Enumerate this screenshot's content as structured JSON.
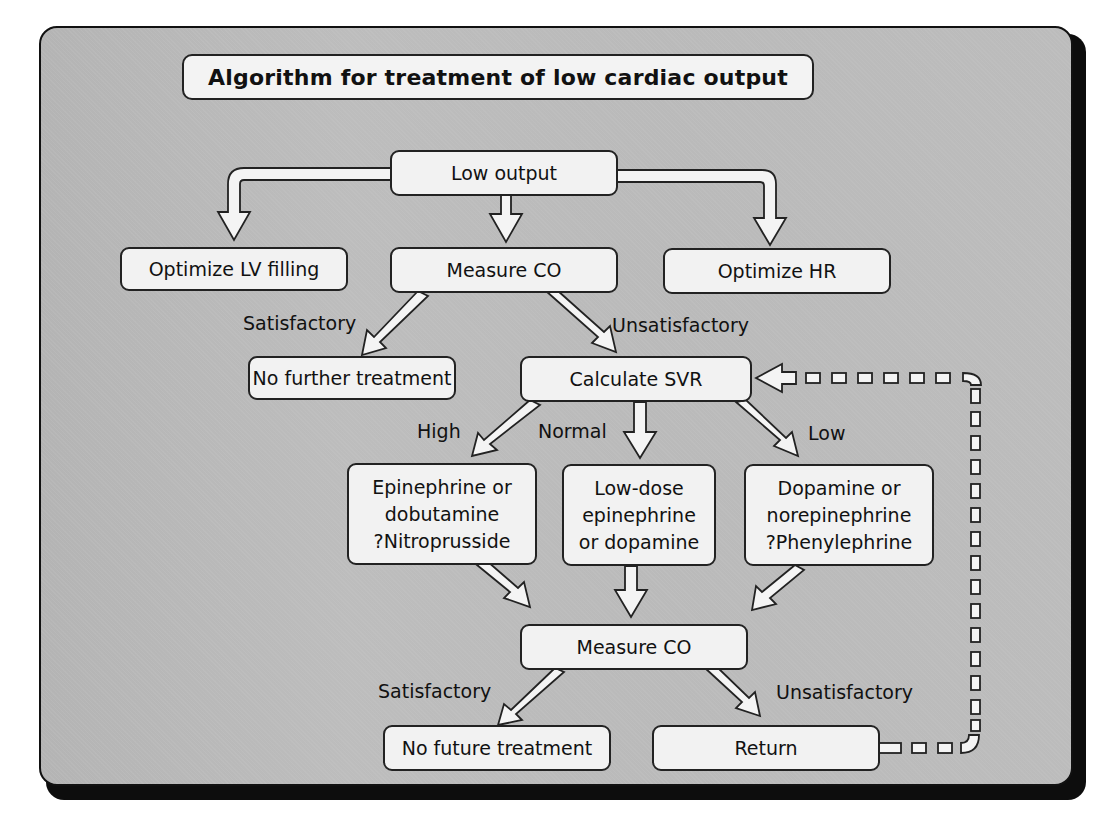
{
  "title": "Algorithm for treatment of low cardiac output",
  "nodes": {
    "low_output": "Low output",
    "optimize_lv": "Optimize LV filling",
    "measure_co_1": "Measure CO",
    "optimize_hr": "Optimize HR",
    "no_further_treatment": "No further treatment",
    "calculate_svr": "Calculate SVR",
    "high_svr_treatment": [
      "Epinephrine or",
      "dobutamine",
      "?Nitroprusside"
    ],
    "normal_svr_treatment": [
      "Low-dose",
      "epinephrine",
      "or dopamine"
    ],
    "low_svr_treatment": [
      "Dopamine or",
      "norepinephrine",
      "?Phenylephrine"
    ],
    "measure_co_2": "Measure CO",
    "no_future_treatment": "No future treatment",
    "return": "Return"
  },
  "edge_labels": {
    "satisfactory_1": "Satisfactory",
    "unsatisfactory_1": "Unsatisfactory",
    "high": "High",
    "normal": "Normal",
    "low": "Low",
    "satisfactory_2": "Satisfactory",
    "unsatisfactory_2": "Unsatisfactory"
  },
  "colors": {
    "panel": "#b9b9b9",
    "box_fill": "#f2f2f2",
    "outline": "#222222",
    "shadow": "#0d0d0d"
  }
}
